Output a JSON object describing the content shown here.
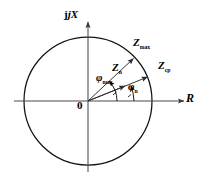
{
  "figure": {
    "type": "complex-impedance-plane-diagram",
    "background_color": "#ffffff",
    "stroke_color": "#000000",
    "axis_color": "#4a4a4a"
  },
  "axes": {
    "imaginary": {
      "label_main": "jX",
      "label_sub": "",
      "name": "imaginary-axis"
    },
    "real": {
      "label_main": "R",
      "label_sub": "",
      "name": "real-axis"
    },
    "origin": {
      "label": "0"
    }
  },
  "circle": {
    "center_x": 88,
    "center_y": 101,
    "radius": 64
  },
  "vectors": [
    {
      "id": "z-max",
      "label_main": "Z",
      "label_sub": "max",
      "angle_deg": 42,
      "length": 64
    },
    {
      "id": "z-cp",
      "label_main": "Z",
      "label_sub": "cp",
      "angle_deg": 22,
      "length": 64
    },
    {
      "id": "z-n",
      "label_main": "Z",
      "label_sub": "n",
      "angle_deg": 22,
      "length": 40
    }
  ],
  "angles": [
    {
      "id": "phi-max",
      "label_main": "φ",
      "label_sub": "max",
      "value_deg": 42
    },
    {
      "id": "phi-n",
      "label_main": "φ",
      "label_sub": "n",
      "value_deg": 22
    }
  ]
}
